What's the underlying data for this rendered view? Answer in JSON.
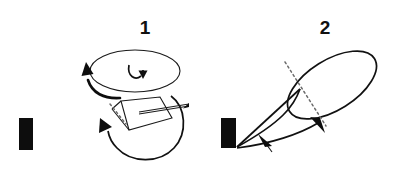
{
  "figure": {
    "background_color": "#ffffff",
    "ink_color": "#0d0d0d",
    "dotted_color": "#6b6b6b",
    "width": 409,
    "height": 178,
    "panels": [
      {
        "id": "panel-1",
        "label": "1",
        "label_x": 145,
        "label_y": 33,
        "bar": {
          "x": 19,
          "y": 118,
          "width": 14,
          "height": 32
        },
        "elements": [
          "horizontal-ellipse",
          "center-spin-arrow",
          "left-curved-arrow",
          "large-circular-arrow",
          "flat-plate-quadrilateral",
          "needle-pointer"
        ]
      },
      {
        "id": "panel-2",
        "label": "2",
        "label_x": 325,
        "label_y": 33,
        "bar": {
          "x": 221,
          "y": 118,
          "width": 15,
          "height": 30
        },
        "elements": [
          "tilted-ellipse",
          "dotted-axis-line",
          "upper-converging-line",
          "lower-converging-curve",
          "ellipse-arrowhead",
          "lower-arrow"
        ]
      }
    ]
  }
}
